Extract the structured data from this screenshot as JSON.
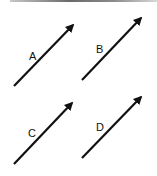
{
  "diagram": {
    "arrows": [
      {
        "label": "A",
        "x1": 14,
        "y1": 86,
        "x2": 73,
        "y2": 25,
        "lx": 29,
        "ly": 60
      },
      {
        "label": "B",
        "x1": 82,
        "y1": 80,
        "x2": 141,
        "y2": 18,
        "lx": 96,
        "ly": 53
      },
      {
        "label": "C",
        "x1": 14,
        "y1": 164,
        "x2": 72,
        "y2": 103,
        "lx": 28,
        "ly": 137
      },
      {
        "label": "D",
        "x1": 82,
        "y1": 158,
        "x2": 141,
        "y2": 97,
        "lx": 96,
        "ly": 131
      }
    ],
    "stroke_color": "#111111"
  }
}
